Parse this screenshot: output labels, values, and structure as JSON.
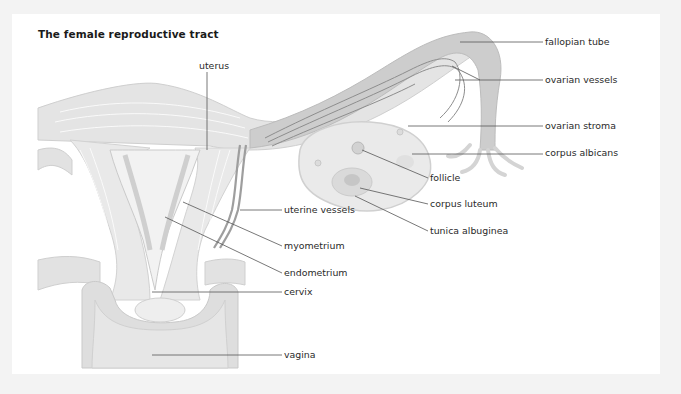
{
  "title": "The female reproductive tract",
  "colors": {
    "background_frame": "#f3f3f3",
    "panel": "#ffffff",
    "tissue_light": "#ebebeb",
    "tissue_mid": "#dcdcdc",
    "tissue_dark": "#bdbdbd",
    "vessel": "#9a9a9a",
    "leader_line": "#555555",
    "text": "#2a2a2a"
  },
  "labels": [
    {
      "id": "uterus",
      "text": "uterus",
      "x": 199,
      "y": 60
    },
    {
      "id": "fallopian-tube",
      "text": "fallopian tube",
      "x": 545,
      "y": 36
    },
    {
      "id": "ovarian-vessels",
      "text": "ovarian vessels",
      "x": 545,
      "y": 74
    },
    {
      "id": "ovarian-stroma",
      "text": "ovarian stroma",
      "x": 545,
      "y": 120
    },
    {
      "id": "corpus-albicans",
      "text": "corpus albicans",
      "x": 545,
      "y": 147
    },
    {
      "id": "follicle",
      "text": "follicle",
      "x": 430,
      "y": 172
    },
    {
      "id": "corpus-luteum",
      "text": "corpus luteum",
      "x": 430,
      "y": 198
    },
    {
      "id": "tunica-albuginea",
      "text": "tunica albuginea",
      "x": 430,
      "y": 225
    },
    {
      "id": "uterine-vessels",
      "text": "uterine vessels",
      "x": 284,
      "y": 204
    },
    {
      "id": "myometrium",
      "text": "myometrium",
      "x": 284,
      "y": 240
    },
    {
      "id": "endometrium",
      "text": "endometrium",
      "x": 284,
      "y": 267
    },
    {
      "id": "cervix",
      "text": "cervix",
      "x": 284,
      "y": 286
    },
    {
      "id": "vagina",
      "text": "vagina",
      "x": 284,
      "y": 349
    }
  ]
}
